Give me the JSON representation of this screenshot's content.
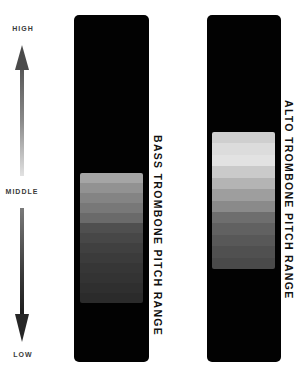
{
  "scale": {
    "high_label": "HIGH",
    "middle_label": "MIDDLE",
    "low_label": "LOW"
  },
  "instruments": [
    {
      "name": "BASS TROMBONE PITCH RANGE",
      "bands": [
        "#a5a5a5",
        "#929292",
        "#848484",
        "#787878",
        "#6a6a6a",
        "#4f4f4f",
        "#474747",
        "#404040",
        "#3b3b3b",
        "#363636",
        "#333333",
        "#2f2f2f",
        "#2b2b2b"
      ]
    },
    {
      "name": "ALTO TROMBONE PITCH RANGE",
      "bands": [
        "#cfcfcf",
        "#dcdcdc",
        "#e2e2e2",
        "#cacaca",
        "#b4b4b4",
        "#9e9e9e",
        "#8a8a8a",
        "#6e6e6e",
        "#616161",
        "#585858",
        "#505050",
        "#4a4a4a"
      ]
    }
  ],
  "colors": {
    "panel": "#020202",
    "background": "#ffffff",
    "text": "#111111"
  }
}
